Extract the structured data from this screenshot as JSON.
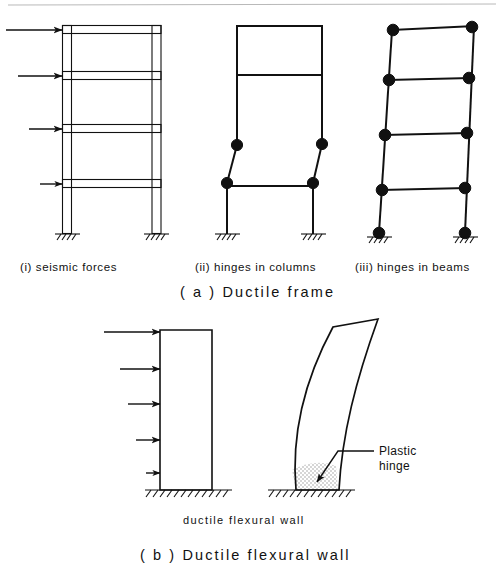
{
  "figure": {
    "title_a": "( a )  Ductile  frame",
    "title_b": "( b )  Ductile  flexural  wall",
    "panel_a": {
      "captions": [
        "(i)  seismic  forces",
        "(ii)  hinges  in  columns",
        "(iii)  hinges  in  beams"
      ]
    },
    "panel_b": {
      "caption": "ductile  flexural  wall",
      "annotation_line1": "Plastic",
      "annotation_line2": "hinge"
    },
    "colors": {
      "ink": "#111111",
      "paper": "#ffffff",
      "stipple": "#d8d8d8",
      "scan_rule": "#b9b9b9"
    }
  },
  "diagram_data": {
    "type": "engineering-diagram",
    "subject": "Seismic collapse mechanisms of ductile frames and flexural walls",
    "frame_i": {
      "name": "seismic forces",
      "stories": 4,
      "bays": 1,
      "double_line_members": true,
      "frame_left": 62,
      "frame_right": 161,
      "frame_top": 25,
      "frame_base": 233,
      "member_thickness": 9,
      "beam_levels": [
        25,
        72,
        125,
        180
      ],
      "lateral_force_arrows": [
        {
          "y": 30,
          "length": 56
        },
        {
          "y": 76,
          "length": 44
        },
        {
          "y": 129,
          "length": 33
        },
        {
          "y": 184,
          "length": 22
        }
      ],
      "supports": [
        {
          "x": 67
        },
        {
          "x": 156
        }
      ]
    },
    "frame_ii": {
      "name": "hinges in columns",
      "mechanism": "soft-storey sway: hinges at top and bottom of second-storey columns",
      "undeformed_top": 25,
      "frame_base": 233,
      "hinge_radius": 5.6,
      "hinges": [
        {
          "x": 237,
          "y": 145
        },
        {
          "x": 227,
          "y": 183
        },
        {
          "x": 322,
          "y": 144
        },
        {
          "x": 313,
          "y": 183
        }
      ],
      "beam_levels_y": [
        25,
        75,
        145,
        186
      ],
      "supports": [
        {
          "x": 227
        },
        {
          "x": 313
        }
      ]
    },
    "frame_iii": {
      "name": "hinges in beams",
      "mechanism": "beam-sway: hinges at both ends of every beam plus column bases",
      "hinge_radius": 5.8,
      "hinge_count": 10,
      "supports": [
        {
          "x": 379,
          "y": 233
        },
        {
          "x": 465,
          "y": 233
        }
      ],
      "beam_levels_y": [
        30,
        80,
        135,
        190
      ]
    },
    "wall_left": {
      "name": "ductile flexural wall under seismic forces",
      "left": 160,
      "right": 212,
      "top": 330,
      "base": 490,
      "lateral_force_arrows": [
        {
          "y": 332,
          "length": 58
        },
        {
          "y": 369,
          "length": 42
        },
        {
          "y": 404,
          "length": 34
        },
        {
          "y": 440,
          "length": 26
        },
        {
          "y": 473,
          "length": 16
        }
      ]
    },
    "wall_right": {
      "name": "deformed wall with plastic hinge at base",
      "base_left": 255,
      "base_right": 295,
      "top_left_x": 310,
      "top_y": 325,
      "plastic_hinge_zone": {
        "fill": "stipple",
        "height": 28,
        "description": "shaded region at wall base where plastic hinge forms"
      }
    },
    "ground_lines": [
      {
        "x1": 145,
        "x2": 232,
        "y": 490
      },
      {
        "x1": 240,
        "x2": 320,
        "y": 490
      }
    ]
  }
}
